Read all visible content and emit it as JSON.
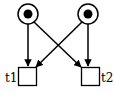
{
  "diagram": {
    "type": "petri-net",
    "stroke_color": "#000000",
    "background": "#ffffff",
    "places": [
      {
        "id": "p1",
        "cx": 28,
        "cy": 14,
        "r": 10,
        "tokens": 1
      },
      {
        "id": "p2",
        "cx": 88,
        "cy": 14,
        "r": 10,
        "tokens": 1
      }
    ],
    "transitions": [
      {
        "id": "t1",
        "label": "t1",
        "x": 18,
        "y": 67,
        "w": 18,
        "h": 18
      },
      {
        "id": "t2",
        "label": "t2",
        "x": 81,
        "y": 67,
        "w": 18,
        "h": 18
      }
    ],
    "arcs": [
      {
        "from": "p1",
        "to": "t1"
      },
      {
        "from": "p1",
        "to": "t2"
      },
      {
        "from": "p2",
        "to": "t1"
      },
      {
        "from": "p2",
        "to": "t2"
      }
    ]
  }
}
